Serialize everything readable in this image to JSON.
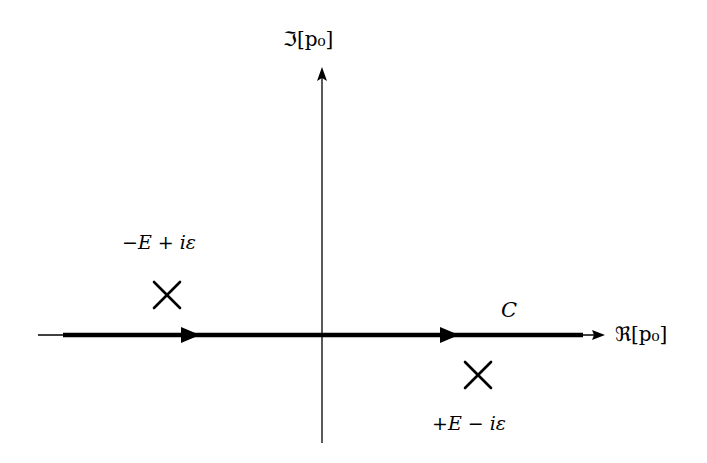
{
  "diagram": {
    "axes": {
      "imaginary_label": "ℑ[p₀]",
      "real_label": "ℜ[p₀]"
    },
    "contour": {
      "label": "C"
    },
    "poles": [
      {
        "label": "−E + iε",
        "position": "upper-left"
      },
      {
        "label": "+E − iε",
        "position": "lower-right"
      }
    ],
    "colors": {
      "background": "#ffffff",
      "ink": "#000000"
    }
  }
}
